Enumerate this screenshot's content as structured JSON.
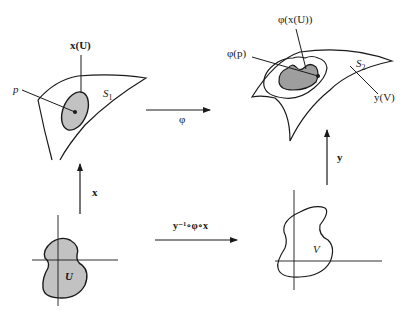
{
  "figure": {
    "surface_1": {
      "name_label": "S",
      "name_subscript": "1",
      "point_label": "p",
      "patch_label": "x(U)"
    },
    "surface_2": {
      "name_label": "S",
      "name_subscript": "2",
      "point_label": "φ(p)",
      "patch_image_label": "φ(x(U))",
      "chart_image_label": "y(V)"
    },
    "maps": {
      "phi": "φ",
      "x": "x",
      "y": "y",
      "composite": "y⁻¹∘φ∘x"
    },
    "domains": {
      "u_label": "U",
      "v_label": "V"
    },
    "colors": {
      "stroke": "#1a1a1a",
      "fill_light": "#c8c8c8",
      "fill_dark": "#9a9a9a",
      "background": "#ffffff"
    }
  }
}
